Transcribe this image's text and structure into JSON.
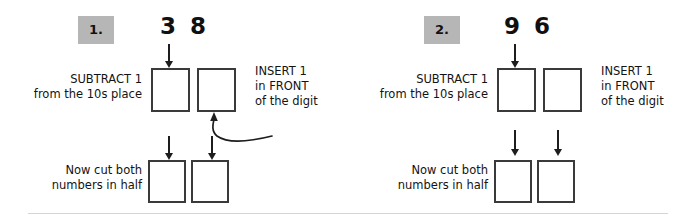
{
  "page": {
    "background_color": "#ffffff",
    "badge_color": "#b6b6b6",
    "ink_color": "#1d1d1d",
    "box_border_color": "#3a3a3a",
    "divider_color": "#d4d4d4"
  },
  "problems": [
    {
      "badge_label": "1.",
      "digits": "3 8",
      "tens_digit": "3",
      "ones_digit": "8",
      "left_label": "SUBTRACT 1\nfrom the 10s place",
      "right_label": "INSERT 1\nin FRONT\nof the digit",
      "bottom_label": "Now cut both\nnumbers in half",
      "top_boxes": [
        "",
        ""
      ],
      "bottom_boxes": [
        "",
        ""
      ],
      "has_curved_arrow": true
    },
    {
      "badge_label": "2.",
      "digits": "9 6",
      "tens_digit": "9",
      "ones_digit": "6",
      "left_label": "SUBTRACT 1\nfrom the 10s place",
      "right_label": "INSERT 1\nin FRONT\nof the digit",
      "bottom_label": "Now cut both\nnumbers in half",
      "top_boxes": [
        "",
        ""
      ],
      "bottom_boxes": [
        "",
        ""
      ],
      "has_curved_arrow": false
    }
  ],
  "icons": {
    "arrow_down": "arrow-down-icon",
    "curved_arrow": "curved-arrow-icon"
  }
}
